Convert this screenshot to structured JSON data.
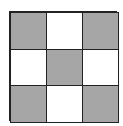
{
  "diagram": {
    "type": "grid",
    "rows": 3,
    "cols": 3,
    "cells": [
      [
        "filled",
        "empty",
        "filled"
      ],
      [
        "empty",
        "filled",
        "empty"
      ],
      [
        "filled",
        "empty",
        "filled"
      ]
    ],
    "colors": {
      "filled": "#a6a6a6",
      "empty": "#ffffff",
      "border": "#222222"
    }
  }
}
